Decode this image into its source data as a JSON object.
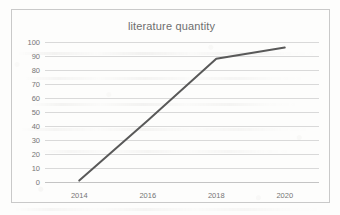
{
  "chart_data": {
    "type": "line",
    "title": "literature quantity",
    "xlabel": "",
    "ylabel": "",
    "categories": [
      "2014",
      "2016",
      "2018",
      "2020"
    ],
    "x": [
      2014,
      2016,
      2018,
      2020
    ],
    "values": [
      1,
      44,
      88,
      96
    ],
    "series": [
      {
        "name": "literature quantity",
        "values": [
          1,
          44,
          88,
          96
        ]
      }
    ],
    "ylim": [
      0,
      100
    ],
    "ytick_labels": [
      "100",
      "90",
      "80",
      "70",
      "60",
      "50",
      "40",
      "30",
      "20",
      "10",
      "0"
    ],
    "yticks": [
      100,
      90,
      80,
      70,
      60,
      50,
      40,
      30,
      20,
      10,
      0
    ],
    "xtick_labels": [
      "2014",
      "2016",
      "2018",
      "2020"
    ],
    "grid": "horizontal",
    "legend": "none",
    "line_color": "#595959",
    "grid_color": "#d9d9d9",
    "title_color": "#6e6e6e",
    "tick_label_color": "#757575",
    "border_color": "#c9c9c9",
    "background_color": "#ffffff"
  }
}
